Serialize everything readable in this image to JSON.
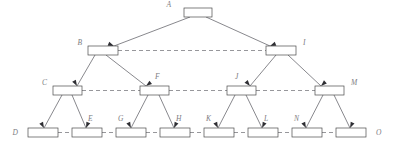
{
  "diagram": {
    "type": "tree-with-sibling-links",
    "colors": {
      "box_fill": "#ffffff",
      "box_stroke": "#4a4a4a",
      "solid_edge": "#55555c",
      "dashed_edge": "#6a6a70",
      "label_text": "#7d7d82",
      "arrow_fill": "#2e2e33",
      "background": "#ffffff"
    },
    "levels": [
      {
        "level": 1,
        "nodes": [
          {
            "id": "A",
            "label": "A",
            "x": 184,
            "y": 8,
            "w": 28,
            "h": 9,
            "label_x": 171,
            "label_y": 7,
            "label_anchor": "end"
          }
        ]
      },
      {
        "level": 2,
        "nodes": [
          {
            "id": "B",
            "label": "B",
            "x": 88,
            "y": 46,
            "w": 30,
            "h": 9,
            "label_x": 82,
            "label_y": 45,
            "label_anchor": "end"
          },
          {
            "id": "I",
            "label": "I",
            "x": 266,
            "y": 46,
            "w": 30,
            "h": 9,
            "label_x": 303,
            "label_y": 45,
            "label_anchor": "start"
          }
        ]
      },
      {
        "level": 3,
        "nodes": [
          {
            "id": "C",
            "label": "C",
            "x": 53,
            "y": 86,
            "w": 29,
            "h": 9,
            "label_x": 47,
            "label_y": 85,
            "label_anchor": "end"
          },
          {
            "id": "F",
            "label": "F",
            "x": 140,
            "y": 86,
            "w": 29,
            "h": 9,
            "label_x": 155,
            "label_y": 79,
            "label_anchor": "start"
          },
          {
            "id": "J",
            "label": "J",
            "x": 227,
            "y": 86,
            "w": 29,
            "h": 9,
            "label_x": 235,
            "label_y": 79,
            "label_anchor": "start"
          },
          {
            "id": "M",
            "label": "M",
            "x": 315,
            "y": 86,
            "w": 29,
            "h": 9,
            "label_x": 351,
            "label_y": 85,
            "label_anchor": "start"
          }
        ]
      },
      {
        "level": 4,
        "nodes": [
          {
            "id": "D",
            "label": "D",
            "x": 28,
            "y": 128,
            "w": 30,
            "h": 9,
            "label_x": 18,
            "label_y": 135,
            "label_anchor": "end"
          },
          {
            "id": "E",
            "label": "E",
            "x": 72,
            "y": 128,
            "w": 30,
            "h": 9,
            "label_x": 88,
            "label_y": 121,
            "label_anchor": "start"
          },
          {
            "id": "G",
            "label": "G",
            "x": 116,
            "y": 128,
            "w": 30,
            "h": 9,
            "label_x": 118,
            "label_y": 121,
            "label_anchor": "start"
          },
          {
            "id": "H",
            "label": "H",
            "x": 160,
            "y": 128,
            "w": 30,
            "h": 9,
            "label_x": 176,
            "label_y": 121,
            "label_anchor": "start"
          },
          {
            "id": "K",
            "label": "K",
            "x": 204,
            "y": 128,
            "w": 30,
            "h": 9,
            "label_x": 206,
            "label_y": 121,
            "label_anchor": "start"
          },
          {
            "id": "L",
            "label": "L",
            "x": 248,
            "y": 128,
            "w": 30,
            "h": 9,
            "label_x": 264,
            "label_y": 121,
            "label_anchor": "start"
          },
          {
            "id": "N",
            "label": "N",
            "x": 292,
            "y": 128,
            "w": 30,
            "h": 9,
            "label_x": 294,
            "label_y": 121,
            "label_anchor": "start"
          },
          {
            "id": "O",
            "label": "O",
            "x": 336,
            "y": 128,
            "w": 30,
            "h": 9,
            "label_x": 376,
            "label_y": 135,
            "label_anchor": "start"
          }
        ]
      }
    ],
    "solid_edges": [
      {
        "from": "A",
        "to": "B",
        "x1": 190,
        "y1": 17,
        "x2": 114,
        "y2": 46
      },
      {
        "from": "A",
        "to": "I",
        "x1": 206,
        "y1": 17,
        "x2": 270,
        "y2": 46
      },
      {
        "from": "B",
        "to": "C",
        "x1": 95,
        "y1": 55,
        "x2": 77,
        "y2": 86
      },
      {
        "from": "B",
        "to": "F",
        "x1": 106,
        "y1": 55,
        "x2": 146,
        "y2": 86
      },
      {
        "from": "I",
        "to": "J",
        "x1": 276,
        "y1": 55,
        "x2": 250,
        "y2": 86
      },
      {
        "from": "I",
        "to": "M",
        "x1": 288,
        "y1": 55,
        "x2": 321,
        "y2": 86
      },
      {
        "from": "C",
        "to": "D",
        "x1": 62,
        "y1": 95,
        "x2": 44,
        "y2": 128
      },
      {
        "from": "C",
        "to": "E",
        "x1": 72,
        "y1": 95,
        "x2": 86,
        "y2": 128
      },
      {
        "from": "F",
        "to": "G",
        "x1": 148,
        "y1": 95,
        "x2": 131,
        "y2": 128
      },
      {
        "from": "F",
        "to": "H",
        "x1": 159,
        "y1": 95,
        "x2": 174,
        "y2": 128
      },
      {
        "from": "J",
        "to": "K",
        "x1": 235,
        "y1": 95,
        "x2": 218,
        "y2": 128
      },
      {
        "from": "J",
        "to": "L",
        "x1": 246,
        "y1": 95,
        "x2": 262,
        "y2": 128
      },
      {
        "from": "M",
        "to": "N",
        "x1": 323,
        "y1": 95,
        "x2": 306,
        "y2": 128
      },
      {
        "from": "M",
        "to": "O",
        "x1": 334,
        "y1": 95,
        "x2": 350,
        "y2": 128
      }
    ],
    "dashed_edges": [
      {
        "from": "B",
        "to": "I",
        "x1": 118,
        "y1": 50.5,
        "x2": 266,
        "y2": 50.5
      },
      {
        "from": "C",
        "to": "F",
        "x1": 82,
        "y1": 90.5,
        "x2": 140,
        "y2": 90.5
      },
      {
        "from": "F",
        "to": "J",
        "x1": 169,
        "y1": 90.5,
        "x2": 227,
        "y2": 90.5
      },
      {
        "from": "J",
        "to": "M",
        "x1": 256,
        "y1": 90.5,
        "x2": 315,
        "y2": 90.5
      },
      {
        "from": "D",
        "to": "E",
        "x1": 58,
        "y1": 132.5,
        "x2": 72,
        "y2": 132.5
      },
      {
        "from": "E",
        "to": "G",
        "x1": 102,
        "y1": 132.5,
        "x2": 116,
        "y2": 132.5
      },
      {
        "from": "G",
        "to": "H",
        "x1": 146,
        "y1": 132.5,
        "x2": 160,
        "y2": 132.5
      },
      {
        "from": "H",
        "to": "K",
        "x1": 190,
        "y1": 132.5,
        "x2": 204,
        "y2": 132.5
      },
      {
        "from": "K",
        "to": "L",
        "x1": 234,
        "y1": 132.5,
        "x2": 248,
        "y2": 132.5
      },
      {
        "from": "L",
        "to": "N",
        "x1": 278,
        "y1": 132.5,
        "x2": 292,
        "y2": 132.5
      },
      {
        "from": "N",
        "to": "O",
        "x1": 322,
        "y1": 132.5,
        "x2": 336,
        "y2": 132.5
      }
    ],
    "arrow_heads": [
      {
        "target": "B",
        "x": 114,
        "y": 46,
        "angle": 22
      },
      {
        "target": "I",
        "x": 270,
        "y": 46,
        "angle": 158
      },
      {
        "target": "C",
        "x": 77,
        "y": 86,
        "angle": 60
      },
      {
        "target": "F",
        "x": 146,
        "y": 86,
        "angle": 142
      },
      {
        "target": "J",
        "x": 250,
        "y": 86,
        "angle": 50
      },
      {
        "target": "M",
        "x": 321,
        "y": 86,
        "angle": 137
      },
      {
        "target": "D",
        "x": 44,
        "y": 128,
        "angle": 62
      },
      {
        "target": "E",
        "x": 86,
        "y": 128,
        "angle": 113
      },
      {
        "target": "G",
        "x": 131,
        "y": 128,
        "angle": 63
      },
      {
        "target": "H",
        "x": 174,
        "y": 128,
        "angle": 115
      },
      {
        "target": "K",
        "x": 218,
        "y": 128,
        "angle": 63
      },
      {
        "target": "L",
        "x": 262,
        "y": 128,
        "angle": 116
      },
      {
        "target": "N",
        "x": 306,
        "y": 128,
        "angle": 63
      },
      {
        "target": "O",
        "x": 350,
        "y": 128,
        "angle": 116
      },
      {
        "target": "B-link",
        "x": 266,
        "y": 50.5,
        "angle": 180
      },
      {
        "target": "C-link",
        "x": 140,
        "y": 90.5,
        "angle": 180
      },
      {
        "target": "F-link",
        "x": 227,
        "y": 90.5,
        "angle": 180
      },
      {
        "target": "J-link",
        "x": 315,
        "y": 90.5,
        "angle": 180
      },
      {
        "target": "D-link",
        "x": 72,
        "y": 132.5,
        "angle": 180
      },
      {
        "target": "E-link",
        "x": 116,
        "y": 132.5,
        "angle": 180
      },
      {
        "target": "G-link",
        "x": 160,
        "y": 132.5,
        "angle": 180
      },
      {
        "target": "H-link",
        "x": 204,
        "y": 132.5,
        "angle": 180
      },
      {
        "target": "K-link",
        "x": 248,
        "y": 132.5,
        "angle": 180
      },
      {
        "target": "L-link",
        "x": 292,
        "y": 132.5,
        "angle": 180
      },
      {
        "target": "N-link",
        "x": 336,
        "y": 132.5,
        "angle": 180
      }
    ]
  }
}
